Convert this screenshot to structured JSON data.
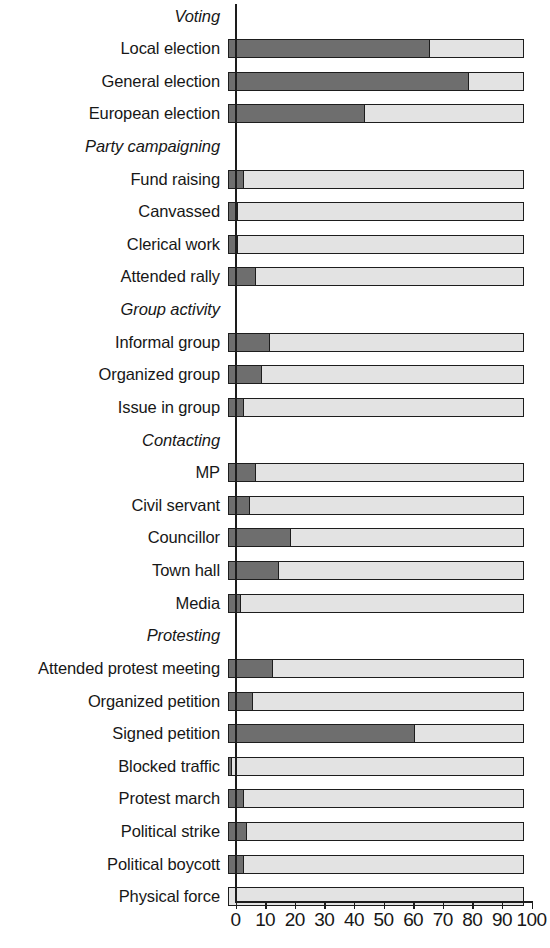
{
  "chart_data": {
    "type": "bar",
    "orientation": "horizontal",
    "stacked": true,
    "title": "",
    "xlabel": "",
    "ylabel": "",
    "xlim": [
      0,
      100
    ],
    "xticks": [
      "0",
      "10",
      "20",
      "30",
      "40",
      "50",
      "60",
      "70",
      "80",
      "90",
      "100"
    ],
    "xtick_values": [
      0,
      10,
      20,
      30,
      40,
      50,
      60,
      70,
      80,
      90,
      100
    ],
    "grid": false,
    "legend": "none",
    "colors": {
      "filled": "#6e6e6e",
      "remainder": "#e3e3e3",
      "outline": "#1d1d1d",
      "background": "#ffffff",
      "text": "#171717"
    },
    "series": [
      {
        "name": "Participated",
        "color": "#6e6e6e"
      },
      {
        "name": "Did not participate",
        "color": "#e3e3e3"
      }
    ],
    "groups": [
      {
        "label": "Voting",
        "items": [
          {
            "label": "Local election",
            "value": 68
          },
          {
            "label": "General election",
            "value": 81
          },
          {
            "label": "European election",
            "value": 46
          }
        ]
      },
      {
        "label": "Party campaigning",
        "items": [
          {
            "label": "Fund raising",
            "value": 5
          },
          {
            "label": "Canvassed",
            "value": 3
          },
          {
            "label": "Clerical work",
            "value": 3
          },
          {
            "label": "Attended rally",
            "value": 9
          }
        ]
      },
      {
        "label": "Group activity",
        "items": [
          {
            "label": "Informal group",
            "value": 14
          },
          {
            "label": "Organized group",
            "value": 11
          },
          {
            "label": "Issue in group",
            "value": 5
          }
        ]
      },
      {
        "label": "Contacting",
        "items": [
          {
            "label": "MP",
            "value": 9
          },
          {
            "label": "Civil servant",
            "value": 7
          },
          {
            "label": "Councillor",
            "value": 21
          },
          {
            "label": "Town hall",
            "value": 17
          },
          {
            "label": "Media",
            "value": 4
          }
        ]
      },
      {
        "label": "Protesting",
        "items": [
          {
            "label": "Attended protest meeting",
            "value": 15
          },
          {
            "label": "Organized petition",
            "value": 8
          },
          {
            "label": "Signed petition",
            "value": 63
          },
          {
            "label": "Blocked traffic",
            "value": 1
          },
          {
            "label": "Protest march",
            "value": 5
          },
          {
            "label": "Political strike",
            "value": 6
          },
          {
            "label": "Political boycott",
            "value": 5
          },
          {
            "label": "Physical force",
            "value": 0
          }
        ]
      }
    ]
  }
}
